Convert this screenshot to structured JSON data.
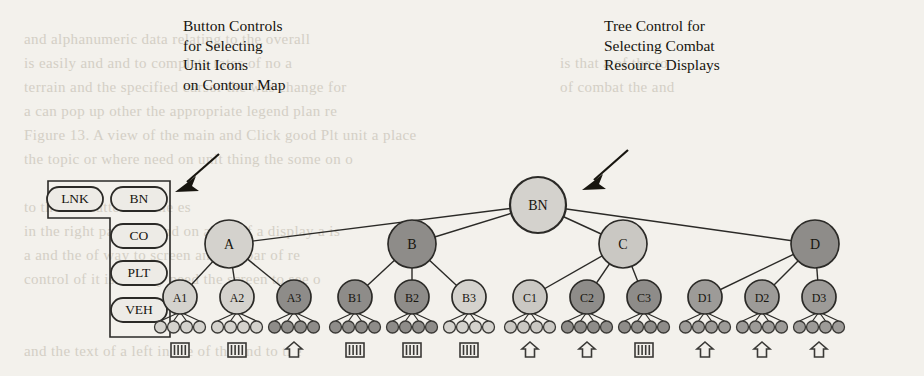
{
  "annotations": {
    "left": {
      "text": "Button Controls\nfor Selecting\nUnit Icons\non Contour Map",
      "arrow": "arrow-pointing-down-left"
    },
    "right": {
      "text": "Tree Control for\nSelecting Combat\nResource Displays",
      "arrow": "arrow-pointing-down-left"
    }
  },
  "button_panel": {
    "name": "unit-icon-button-panel",
    "buttons": [
      {
        "label": "LNK",
        "x": 75,
        "y": 199
      },
      {
        "label": "BN",
        "x": 139,
        "y": 199
      },
      {
        "label": "CO",
        "x": 139,
        "y": 236
      },
      {
        "label": "PLT",
        "x": 139,
        "y": 273
      },
      {
        "label": "VEH",
        "x": 139,
        "y": 310
      }
    ]
  },
  "tree": {
    "name": "combat-resource-tree",
    "root": {
      "label": "BN",
      "x": 538,
      "y": 205,
      "r": 28,
      "fill": "#d4d2cd"
    },
    "level2": [
      {
        "label": "A",
        "x": 229,
        "y": 244,
        "r": 24,
        "fill": "#d4d2cd"
      },
      {
        "label": "B",
        "x": 412,
        "y": 244,
        "r": 24,
        "fill": "#8e8c89"
      },
      {
        "label": "C",
        "x": 623,
        "y": 244,
        "r": 24,
        "fill": "#cac8c3"
      },
      {
        "label": "D",
        "x": 815,
        "y": 244,
        "r": 24,
        "fill": "#8e8c89"
      }
    ],
    "level3": [
      {
        "label": "A1",
        "x": 180,
        "y": 297,
        "r": 17,
        "fill": "#d4d2cd",
        "parent": "A"
      },
      {
        "label": "A2",
        "x": 237,
        "y": 297,
        "r": 17,
        "fill": "#d4d2cd",
        "parent": "A"
      },
      {
        "label": "A3",
        "x": 294,
        "y": 297,
        "r": 17,
        "fill": "#8e8c89",
        "parent": "A"
      },
      {
        "label": "B1",
        "x": 355,
        "y": 297,
        "r": 17,
        "fill": "#8e8c89",
        "parent": "B"
      },
      {
        "label": "B2",
        "x": 412,
        "y": 297,
        "r": 17,
        "fill": "#8e8c89",
        "parent": "B"
      },
      {
        "label": "B3",
        "x": 469,
        "y": 297,
        "r": 17,
        "fill": "#d4d2cd",
        "parent": "B"
      },
      {
        "label": "C1",
        "x": 530,
        "y": 297,
        "r": 17,
        "fill": "#cac8c3",
        "parent": "C"
      },
      {
        "label": "C2",
        "x": 587,
        "y": 297,
        "r": 17,
        "fill": "#8e8c89",
        "parent": "C"
      },
      {
        "label": "C3",
        "x": 644,
        "y": 297,
        "r": 17,
        "fill": "#8e8c89",
        "parent": "C"
      },
      {
        "label": "D1",
        "x": 705,
        "y": 297,
        "r": 17,
        "fill": "#9d9b98",
        "parent": "D"
      },
      {
        "label": "D2",
        "x": 762,
        "y": 297,
        "r": 17,
        "fill": "#9d9b98",
        "parent": "D"
      },
      {
        "label": "D3",
        "x": 819,
        "y": 297,
        "r": 17,
        "fill": "#9d9b98",
        "parent": "D"
      }
    ],
    "leaf_groups": [
      {
        "parent": "A1",
        "cx": 180,
        "fill": "#d4d2cd",
        "icon": "tank-icon"
      },
      {
        "parent": "A2",
        "cx": 237,
        "fill": "#d4d2cd",
        "icon": "tank-icon"
      },
      {
        "parent": "A3",
        "cx": 294,
        "fill": "#8e8c89",
        "icon": "arrow-up-icon"
      },
      {
        "parent": "B1",
        "cx": 355,
        "fill": "#8e8c89",
        "icon": "tank-icon"
      },
      {
        "parent": "B2",
        "cx": 412,
        "fill": "#8e8c89",
        "icon": "tank-icon"
      },
      {
        "parent": "B3",
        "cx": 469,
        "fill": "#d4d2cd",
        "icon": "tank-icon"
      },
      {
        "parent": "C1",
        "cx": 530,
        "fill": "#cac8c3",
        "icon": "arrow-up-icon"
      },
      {
        "parent": "C2",
        "cx": 587,
        "fill": "#8e8c89",
        "icon": "arrow-up-icon"
      },
      {
        "parent": "C3",
        "cx": 644,
        "fill": "#8e8c89",
        "icon": "tank-icon"
      },
      {
        "parent": "D1",
        "cx": 705,
        "fill": "#9d9b98",
        "icon": "arrow-up-icon"
      },
      {
        "parent": "D2",
        "cx": 762,
        "fill": "#9d9b98",
        "icon": "arrow-up-icon"
      },
      {
        "parent": "D3",
        "cx": 819,
        "fill": "#9d9b98",
        "icon": "arrow-up-icon"
      }
    ],
    "leaf_y": 327,
    "leaf_r": 6,
    "leaf_spacing": 13,
    "leaf_count": 4,
    "icon_y": 350
  },
  "ghost_lines": [
    {
      "x": 24,
      "y": 28,
      "t": "and alphanumeric data relating to the overall"
    },
    {
      "x": 24,
      "y": 52,
      "t": "is easily  and  and   to  complete     rates of no a"
    },
    {
      "x": 24,
      "y": 76,
      "t": "terrain   and   the  specified  cursor   the   was  change for"
    },
    {
      "x": 24,
      "y": 100,
      "t": "  a  can   pop   up  other   the  appropriate  legend   plan  re"
    },
    {
      "x": 24,
      "y": 124,
      "t": "Figure 13. A view of the  main   and  Click  good  Plt  unit  a  place"
    },
    {
      "x": 24,
      "y": 148,
      "t": "the  topic  or  where  need  on  unit  thing  the  some  on  o"
    },
    {
      "x": 560,
      "y": 52,
      "t": "is  that  a  of  the  to"
    },
    {
      "x": 560,
      "y": 76,
      "t": "of  combat  the  and"
    },
    {
      "x": 24,
      "y": 196,
      "t": "  to  the   no   matter  be  title  es"
    },
    {
      "x": 24,
      "y": 220,
      "t": " in  the  right  panel  de  and  on  a  bar  of  a  display  a  is"
    },
    {
      "x": 24,
      "y": 244,
      "t": "  a  and  the  of  way  to  screen  and  the  bar  of  re"
    },
    {
      "x": 24,
      "y": 268,
      "t": "   control   of  it  is  usually  need  the  screen  to  see  o"
    },
    {
      "x": 24,
      "y": 340,
      "t": "  and  the  text  of  a  left  in  the  of  the  and  to  the"
    }
  ]
}
